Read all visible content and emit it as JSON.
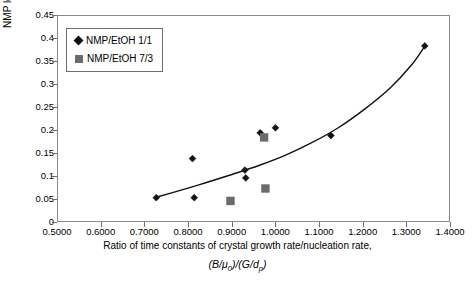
{
  "chart_data": {
    "type": "scatter",
    "title": "",
    "xlabel": "Ratio of time constants of crystal growth rate/nucleation rate,",
    "xlabel_formula": "(B/μ0)/(G/dp)",
    "ylabel": "NMP level, wt%",
    "xlim": [
      0.5,
      1.4
    ],
    "ylim": [
      0,
      0.45
    ],
    "xticks": [
      "0.5000",
      "0.6000",
      "0.7000",
      "0.8000",
      "0.9000",
      "1.0000",
      "1.1000",
      "1.2000",
      "1.3000",
      "1.4000"
    ],
    "xtick_values": [
      0.5,
      0.6,
      0.7,
      0.8,
      0.9,
      1.0,
      1.1,
      1.2,
      1.3,
      1.4
    ],
    "yticks": [
      "0",
      "0.05",
      "0.1",
      "0.15",
      "0.2",
      "0.25",
      "0.3",
      "0.35",
      "0.4",
      "0.45"
    ],
    "ytick_values": [
      0,
      0.05,
      0.1,
      0.15,
      0.2,
      0.25,
      0.3,
      0.35,
      0.4,
      0.45
    ],
    "grid": false,
    "legend_position": "top-left",
    "series": [
      {
        "name": "NMP/EtOH 1/1",
        "marker": "diamond",
        "color": "#111111",
        "points": [
          [
            0.725,
            0.055
          ],
          [
            0.812,
            0.055
          ],
          [
            0.808,
            0.14
          ],
          [
            0.928,
            0.115
          ],
          [
            0.93,
            0.098
          ],
          [
            0.963,
            0.196
          ],
          [
            0.998,
            0.207
          ],
          [
            1.125,
            0.19
          ],
          [
            1.34,
            0.385
          ]
        ]
      },
      {
        "name": "NMP/EtOH 7/3",
        "marker": "square",
        "color": "#6b6b6b",
        "points": [
          [
            0.895,
            0.048
          ],
          [
            0.975,
            0.075
          ],
          [
            0.972,
            0.186
          ]
        ]
      }
    ],
    "trendline": {
      "label": "fitted curve",
      "color": "#111111",
      "points": [
        [
          0.723,
          0.0555
        ],
        [
          0.78,
          0.071
        ],
        [
          0.84,
          0.088
        ],
        [
          0.9,
          0.106
        ],
        [
          0.96,
          0.125
        ],
        [
          1.02,
          0.147
        ],
        [
          1.08,
          0.174
        ],
        [
          1.14,
          0.206
        ],
        [
          1.2,
          0.246
        ],
        [
          1.26,
          0.293
        ],
        [
          1.31,
          0.344
        ],
        [
          1.34,
          0.3845
        ]
      ]
    }
  },
  "legend": {
    "items": [
      {
        "label": "NMP/EtOH 1/1",
        "marker": "diamond"
      },
      {
        "label": "NMP/EtOH 7/3",
        "marker": "square"
      }
    ]
  }
}
